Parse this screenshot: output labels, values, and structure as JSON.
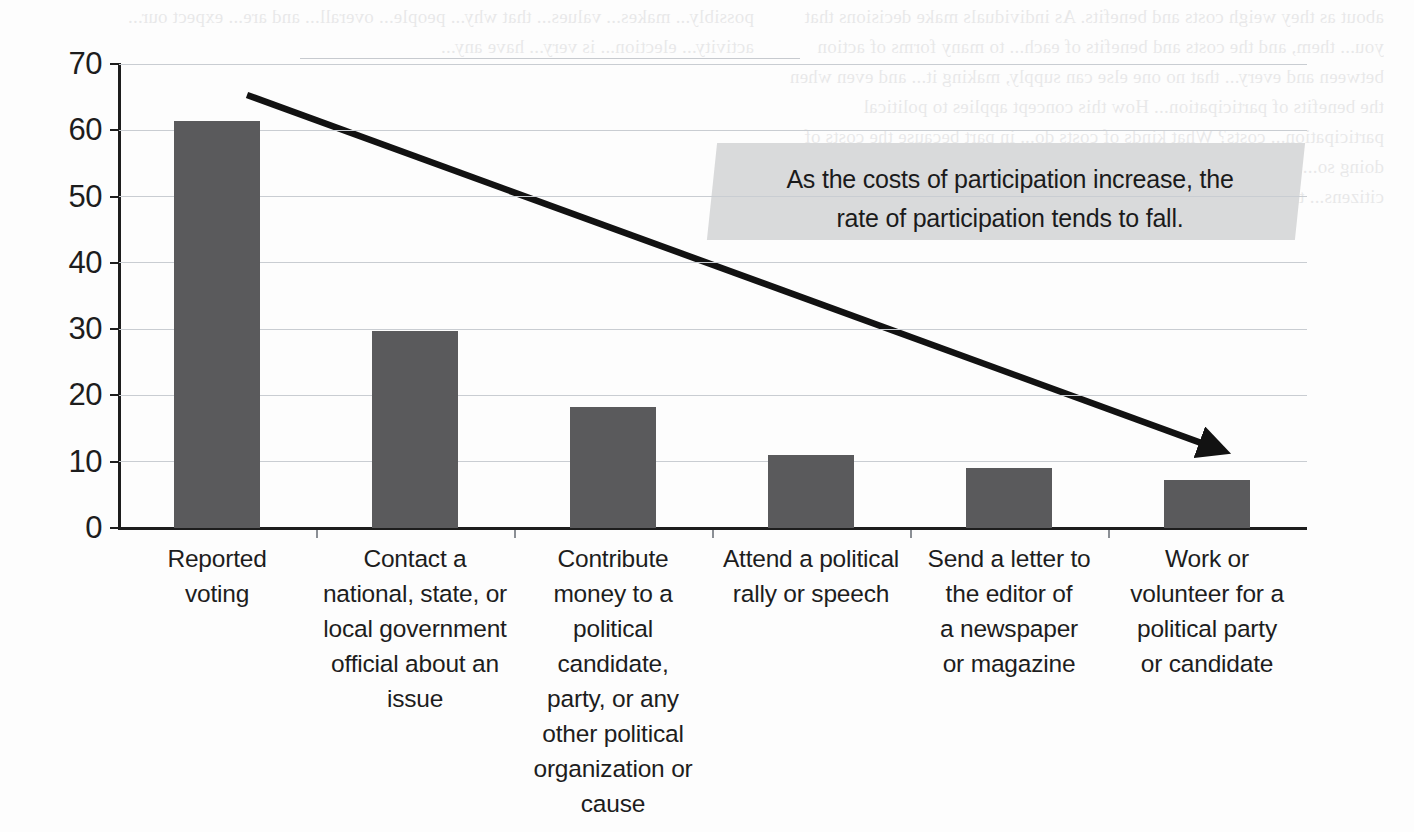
{
  "chart_data": {
    "type": "bar",
    "title": "",
    "subtitle": "",
    "xlabel": "",
    "ylabel": "",
    "ylim": [
      0,
      70
    ],
    "y_ticks": [
      0,
      10,
      20,
      30,
      40,
      50,
      60,
      70
    ],
    "grid": true,
    "legend": "none",
    "bar_color": "#5a5a5c",
    "categories": [
      "Reported voting",
      "Contact a national, state, or local government official about an issue",
      "Contribute money to a political candidate, party, or any other political organization or cause",
      "Attend a political rally or speech",
      "Send a letter to the editor of a newspaper or magazine",
      "Work or volunteer for a political party or candidate"
    ],
    "category_lines": [
      [
        "Reported",
        "voting"
      ],
      [
        "Contact a",
        "national, state, or",
        "local government",
        "official about an",
        "issue"
      ],
      [
        "Contribute",
        "money to a",
        "political",
        "candidate,",
        "party, or any",
        "other political",
        "organization or",
        "cause"
      ],
      [
        "Attend a political",
        "rally or speech"
      ],
      [
        "Send a letter to",
        "the editor of",
        "a newspaper",
        "or magazine"
      ],
      [
        "Work or",
        "volunteer for a",
        "political party",
        "or candidate"
      ]
    ],
    "values": [
      61.4,
      29.7,
      18.3,
      11.0,
      9.1,
      7.3
    ],
    "annotations": [
      {
        "name": "trend-arrow",
        "kind": "arrow",
        "text": "",
        "from": [
          247,
          95
        ],
        "to": [
          1237,
          456
        ]
      }
    ]
  },
  "callout": {
    "line1": "As the costs of participation increase, the",
    "line2": "rate of participation tends to fall.",
    "background": "#d9dadb"
  },
  "y_axis": {
    "labels": [
      "70",
      "60",
      "50",
      "40",
      "30",
      "20",
      "10",
      "0"
    ]
  },
  "bleed_through": {
    "left": "about as they weigh costs and benefits. As individuals make decisions that you... them, and the costs and benefits of each... to many forms of action between and every... that no one else can supply, making it... and even when the benefits of participation... How this concept applies to political participation... costs? What kinds of costs do... in part because the costs of doing so... the most valuable of all political... behavior is risky, the voice of citizens... the unorganized citizens. It is...",
    "right": "possibly... makes... values... that why... people... overall... and are... expect our... activity... election... is very... have any..."
  }
}
